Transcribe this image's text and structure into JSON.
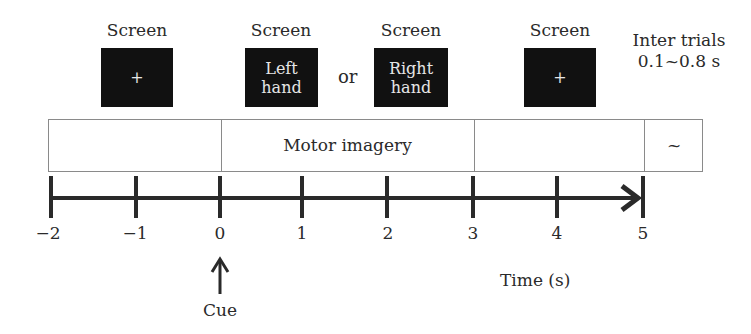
{
  "screens": [
    {
      "label": "Screen",
      "content": "+"
    },
    {
      "label": "Screen",
      "content_line1": "Left",
      "content_line2": "hand"
    },
    {
      "label": "Screen",
      "content_line1": "Right",
      "content_line2": "hand"
    },
    {
      "label": "Screen",
      "content": "+"
    }
  ],
  "or_label": "or",
  "inter_trials": {
    "line1": "Inter trials",
    "line2": "0.1~0.8 s"
  },
  "phases": [
    {
      "label": "",
      "start": -2,
      "end": 0
    },
    {
      "label": "Motor imagery",
      "start": 0,
      "end": 3
    },
    {
      "label": "",
      "start": 3,
      "end": 5
    },
    {
      "label": "~",
      "start": 5,
      "end": null
    }
  ],
  "axis": {
    "ticks": [
      "−2",
      "−1",
      "0",
      "1",
      "2",
      "3",
      "4",
      "5"
    ],
    "label": "Time (s)"
  },
  "cue": {
    "label": "Cue",
    "at": "0"
  },
  "colors": {
    "screen_bg": "#111111",
    "line": "#2a2a2a",
    "box_border": "#8a8a8a"
  }
}
